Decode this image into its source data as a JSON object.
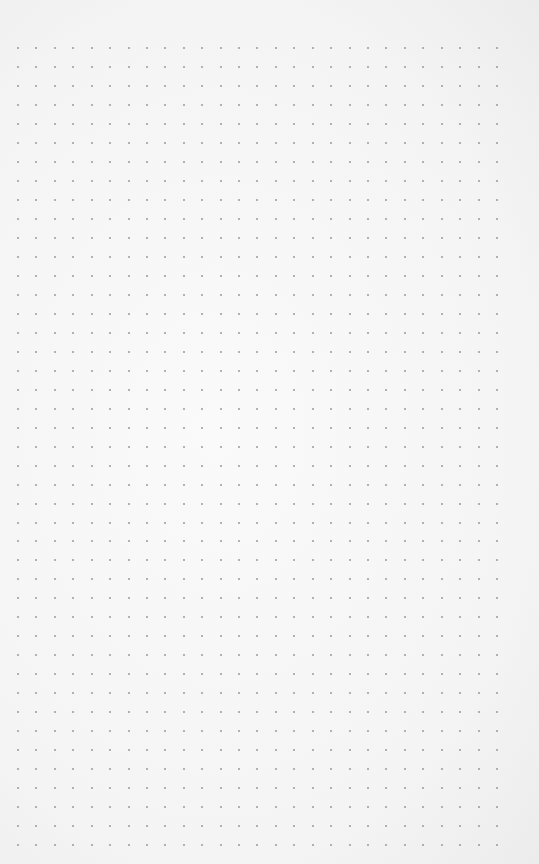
{
  "page": {
    "type": "dot-grid-paper",
    "background_color": "#f6f6f6",
    "dot_color": "#9a9a9a"
  },
  "grid": {
    "columns": 27,
    "rows": 43,
    "origin_x": 18,
    "origin_y": 48,
    "spacing_x": 18.42,
    "spacing_y": 18.98,
    "dot_size": 2
  }
}
